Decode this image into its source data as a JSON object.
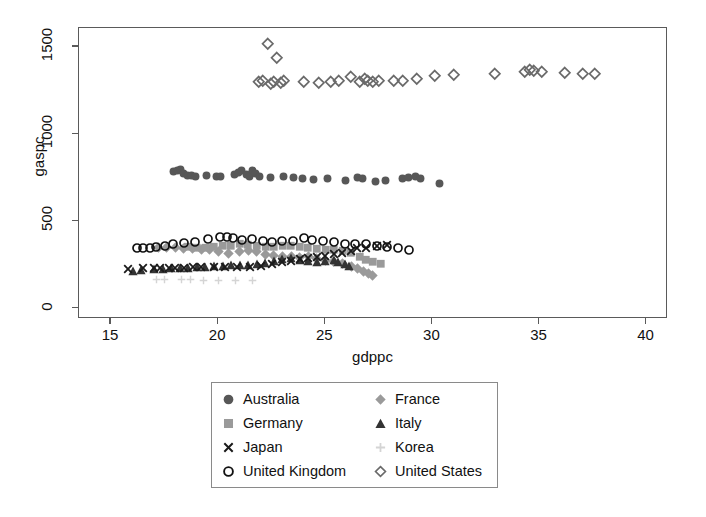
{
  "chart_data": {
    "type": "scatter",
    "title": "",
    "xlabel": "gdppc",
    "ylabel": "gaspc",
    "xlim": [
      13.5,
      41.0
    ],
    "ylim": [
      -60,
      1610
    ],
    "xticks": [
      15,
      20,
      25,
      30,
      35,
      40
    ],
    "yticks": [
      0,
      500,
      1000,
      1500
    ],
    "grid": false,
    "legend_position": "below-center",
    "legend_columns": 2,
    "series": [
      {
        "name": "Australia",
        "marker": "filled-circle",
        "color": "#575757",
        "points": [
          [
            17.9,
            785
          ],
          [
            18.1,
            790
          ],
          [
            18.25,
            800
          ],
          [
            18.4,
            775
          ],
          [
            18.55,
            765
          ],
          [
            18.75,
            762
          ],
          [
            18.95,
            755
          ],
          [
            19.45,
            762
          ],
          [
            19.9,
            760
          ],
          [
            20.1,
            758
          ],
          [
            20.75,
            770
          ],
          [
            20.95,
            782
          ],
          [
            21.1,
            790
          ],
          [
            21.3,
            768
          ],
          [
            21.45,
            758
          ],
          [
            21.6,
            790
          ],
          [
            21.75,
            775
          ],
          [
            21.95,
            755
          ],
          [
            22.45,
            752
          ],
          [
            23.05,
            755
          ],
          [
            23.5,
            752
          ],
          [
            23.95,
            748
          ],
          [
            24.45,
            742
          ],
          [
            25.1,
            745
          ],
          [
            25.95,
            735
          ],
          [
            26.5,
            752
          ],
          [
            26.75,
            748
          ],
          [
            27.35,
            728
          ],
          [
            27.8,
            735
          ],
          [
            28.6,
            748
          ],
          [
            28.9,
            752
          ],
          [
            29.2,
            758
          ],
          [
            29.45,
            745
          ],
          [
            30.35,
            718
          ]
        ]
      },
      {
        "name": "France",
        "marker": "filled-diamond",
        "color": "#9a9a9a",
        "points": [
          [
            17.2,
            352
          ],
          [
            17.6,
            350
          ],
          [
            18.0,
            348
          ],
          [
            18.4,
            345
          ],
          [
            18.8,
            342
          ],
          [
            19.2,
            340
          ],
          [
            19.6,
            338
          ],
          [
            20.0,
            330
          ],
          [
            20.5,
            318
          ],
          [
            21.0,
            330
          ],
          [
            21.4,
            335
          ],
          [
            21.8,
            325
          ],
          [
            22.2,
            312
          ],
          [
            22.6,
            305
          ],
          [
            23.0,
            300
          ],
          [
            23.4,
            298
          ],
          [
            23.8,
            292
          ],
          [
            24.2,
            300
          ],
          [
            24.6,
            285
          ],
          [
            25.0,
            275
          ],
          [
            25.4,
            268
          ],
          [
            25.8,
            258
          ],
          [
            26.2,
            240
          ],
          [
            26.5,
            228
          ],
          [
            26.8,
            215
          ],
          [
            27.0,
            200
          ],
          [
            27.2,
            192
          ]
        ]
      },
      {
        "name": "Germany",
        "marker": "filled-square",
        "color": "#9a9a9a",
        "points": [
          [
            18.6,
            352
          ],
          [
            19.0,
            350
          ],
          [
            19.4,
            348
          ],
          [
            19.8,
            352
          ],
          [
            20.2,
            358
          ],
          [
            20.6,
            360
          ],
          [
            21.0,
            372
          ],
          [
            21.4,
            368
          ],
          [
            21.8,
            358
          ],
          [
            22.2,
            355
          ],
          [
            22.6,
            352
          ],
          [
            23.0,
            360
          ],
          [
            23.4,
            362
          ],
          [
            23.8,
            355
          ],
          [
            24.2,
            350
          ],
          [
            24.6,
            345
          ],
          [
            25.0,
            340
          ],
          [
            25.4,
            338
          ],
          [
            25.8,
            330
          ],
          [
            26.2,
            318
          ],
          [
            26.6,
            300
          ],
          [
            26.9,
            282
          ],
          [
            27.2,
            268
          ],
          [
            27.6,
            258
          ]
        ]
      },
      {
        "name": "Italy",
        "marker": "filled-triangle",
        "color": "#333333",
        "points": [
          [
            16.0,
            218
          ],
          [
            16.4,
            222
          ],
          [
            17.0,
            225
          ],
          [
            17.4,
            228
          ],
          [
            17.8,
            230
          ],
          [
            18.2,
            232
          ],
          [
            18.6,
            235
          ],
          [
            19.0,
            238
          ],
          [
            19.4,
            240
          ],
          [
            19.8,
            242
          ],
          [
            20.2,
            245
          ],
          [
            20.6,
            248
          ],
          [
            21.0,
            250
          ],
          [
            21.4,
            252
          ],
          [
            21.8,
            255
          ],
          [
            22.2,
            262
          ],
          [
            22.6,
            272
          ],
          [
            23.0,
            285
          ],
          [
            23.4,
            290
          ],
          [
            23.8,
            280
          ],
          [
            24.2,
            272
          ],
          [
            24.6,
            268
          ],
          [
            25.0,
            272
          ],
          [
            25.4,
            278
          ],
          [
            25.6,
            268
          ],
          [
            25.9,
            255
          ],
          [
            26.1,
            242
          ]
        ]
      },
      {
        "name": "Japan",
        "marker": "cross-x",
        "color": "#1a1a1a",
        "points": [
          [
            15.8,
            228
          ],
          [
            16.5,
            232
          ],
          [
            17.0,
            235
          ],
          [
            17.3,
            232
          ],
          [
            17.7,
            230
          ],
          [
            18.0,
            232
          ],
          [
            18.4,
            235
          ],
          [
            18.8,
            238
          ],
          [
            19.2,
            236
          ],
          [
            19.8,
            238
          ],
          [
            20.3,
            240
          ],
          [
            20.9,
            238
          ],
          [
            21.5,
            240
          ],
          [
            22.0,
            245
          ],
          [
            22.5,
            258
          ],
          [
            23.0,
            268
          ],
          [
            23.4,
            272
          ],
          [
            23.8,
            282
          ],
          [
            24.2,
            290
          ],
          [
            24.6,
            298
          ],
          [
            25.0,
            302
          ],
          [
            25.4,
            312
          ],
          [
            25.8,
            320
          ],
          [
            26.2,
            330
          ],
          [
            26.5,
            345
          ],
          [
            26.9,
            350
          ],
          [
            27.4,
            360
          ],
          [
            27.9,
            362
          ]
        ]
      },
      {
        "name": "Korea",
        "marker": "plus",
        "color": "#d4d4d4",
        "points": [
          [
            17.1,
            165
          ],
          [
            17.5,
            165
          ],
          [
            18.3,
            165
          ],
          [
            18.7,
            165
          ],
          [
            19.3,
            163
          ],
          [
            20.0,
            163
          ],
          [
            20.8,
            162
          ],
          [
            21.6,
            160
          ]
        ]
      },
      {
        "name": "United Kingdom",
        "marker": "open-circle",
        "color": "#111111",
        "points": [
          [
            16.2,
            345
          ],
          [
            16.5,
            350
          ],
          [
            16.8,
            348
          ],
          [
            17.1,
            352
          ],
          [
            17.5,
            360
          ],
          [
            17.9,
            368
          ],
          [
            18.4,
            378
          ],
          [
            18.9,
            382
          ],
          [
            19.5,
            398
          ],
          [
            20.1,
            408
          ],
          [
            20.4,
            412
          ],
          [
            20.7,
            405
          ],
          [
            21.1,
            392
          ],
          [
            21.6,
            398
          ],
          [
            22.1,
            385
          ],
          [
            22.5,
            382
          ],
          [
            23.0,
            390
          ],
          [
            23.5,
            385
          ],
          [
            24.0,
            402
          ],
          [
            24.4,
            392
          ],
          [
            24.9,
            388
          ],
          [
            25.4,
            382
          ],
          [
            25.9,
            372
          ],
          [
            26.4,
            372
          ],
          [
            26.9,
            368
          ],
          [
            27.4,
            360
          ],
          [
            27.9,
            352
          ],
          [
            28.4,
            348
          ],
          [
            28.9,
            335
          ]
        ]
      },
      {
        "name": "United States",
        "marker": "open-diamond",
        "color": "#6a6a6a",
        "points": [
          [
            21.9,
            1300
          ],
          [
            22.1,
            1305
          ],
          [
            22.3,
            1520
          ],
          [
            22.45,
            1290
          ],
          [
            22.6,
            1300
          ],
          [
            22.75,
            1440
          ],
          [
            22.9,
            1295
          ],
          [
            23.05,
            1310
          ],
          [
            24.0,
            1300
          ],
          [
            24.7,
            1295
          ],
          [
            25.25,
            1300
          ],
          [
            25.65,
            1310
          ],
          [
            26.2,
            1330
          ],
          [
            26.6,
            1300
          ],
          [
            26.85,
            1320
          ],
          [
            27.0,
            1310
          ],
          [
            27.2,
            1300
          ],
          [
            27.5,
            1310
          ],
          [
            28.2,
            1305
          ],
          [
            28.6,
            1310
          ],
          [
            29.25,
            1320
          ],
          [
            30.1,
            1335
          ],
          [
            31.0,
            1340
          ],
          [
            32.9,
            1350
          ],
          [
            34.3,
            1360
          ],
          [
            34.55,
            1370
          ],
          [
            34.75,
            1362
          ],
          [
            35.1,
            1360
          ],
          [
            36.2,
            1355
          ],
          [
            37.0,
            1348
          ],
          [
            37.6,
            1345
          ]
        ]
      }
    ]
  },
  "axes": {
    "ylabel": "gaspc",
    "xlabel": "gdppc",
    "ytick_labels": [
      "0",
      "500",
      "1000",
      "1500"
    ],
    "xtick_labels": [
      "15",
      "20",
      "25",
      "30",
      "35",
      "40"
    ]
  },
  "legend": {
    "entries": [
      {
        "label": "Australia",
        "marker": "filled-circle",
        "color": "#575757"
      },
      {
        "label": "France",
        "marker": "filled-diamond",
        "color": "#9a9a9a"
      },
      {
        "label": "Germany",
        "marker": "filled-square",
        "color": "#9a9a9a"
      },
      {
        "label": "Italy",
        "marker": "filled-triangle",
        "color": "#333333"
      },
      {
        "label": "Japan",
        "marker": "cross-x",
        "color": "#1a1a1a"
      },
      {
        "label": "Korea",
        "marker": "plus",
        "color": "#d4d4d4"
      },
      {
        "label": "United Kingdom",
        "marker": "open-circle",
        "color": "#111111"
      },
      {
        "label": "United States",
        "marker": "open-diamond",
        "color": "#6a6a6a"
      }
    ]
  }
}
